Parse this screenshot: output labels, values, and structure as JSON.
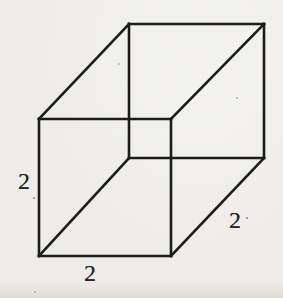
{
  "figure": {
    "type": "cube-wireframe-diagram",
    "background_color": "#edece8",
    "line_color": "#1c1c1c",
    "label_color": "#242424",
    "line_width": 2.6,
    "canvas": {
      "width": 283,
      "height": 298
    },
    "vertices": {
      "front_top_left": [
        39,
        119
      ],
      "front_top_right": [
        171,
        119
      ],
      "front_bottom_right": [
        171,
        256
      ],
      "front_bottom_left": [
        39,
        256
      ],
      "back_top_left": [
        129,
        24
      ],
      "back_top_right": [
        264,
        24
      ],
      "back_bottom_right": [
        264,
        158
      ],
      "back_bottom_left": [
        129,
        158
      ]
    },
    "edges": [
      [
        "front_top_left",
        "front_top_right"
      ],
      [
        "front_top_right",
        "front_bottom_right"
      ],
      [
        "front_bottom_right",
        "front_bottom_left"
      ],
      [
        "front_bottom_left",
        "front_top_left"
      ],
      [
        "back_top_left",
        "back_top_right"
      ],
      [
        "back_top_right",
        "back_bottom_right"
      ],
      [
        "back_bottom_right",
        "back_bottom_left"
      ],
      [
        "back_bottom_left",
        "back_top_left"
      ],
      [
        "front_top_left",
        "back_top_left"
      ],
      [
        "front_top_right",
        "back_top_right"
      ],
      [
        "front_bottom_right",
        "back_bottom_right"
      ],
      [
        "front_bottom_left",
        "back_bottom_left"
      ]
    ],
    "labels": [
      {
        "text": "2",
        "x": 24,
        "y": 182,
        "labels_edge": "front-left-vertical"
      },
      {
        "text": "2",
        "x": 90,
        "y": 274,
        "labels_edge": "front-bottom-horizontal"
      },
      {
        "text": "2",
        "x": 235,
        "y": 221,
        "labels_edge": "right-depth-diagonal"
      }
    ],
    "scan_specks": [
      {
        "x": 33,
        "y": 197,
        "faint": false
      },
      {
        "x": 246,
        "y": 217,
        "faint": false
      },
      {
        "x": 236,
        "y": 97,
        "faint": true
      },
      {
        "x": 118,
        "y": 63,
        "faint": true
      },
      {
        "x": 34,
        "y": 291,
        "faint": true
      }
    ]
  }
}
